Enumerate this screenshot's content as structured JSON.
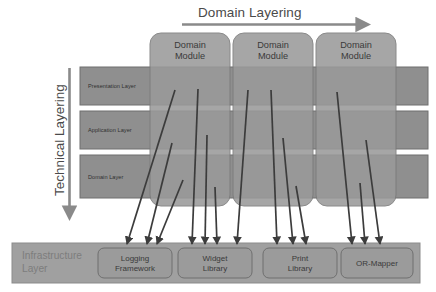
{
  "diagram": {
    "title_top": "Domain Layering",
    "title_left": "Technical Layering",
    "colors": {
      "module_fill": "#9a9a9a",
      "module_stroke": "#7b7b7b",
      "layer_fill": "#8f8f8f",
      "layer_stroke": "#6f6f6f",
      "infra_bar_fill": "#a0a0a0",
      "infra_box_fill": "#9b9b9b",
      "arrow_color": "#3c3c3c",
      "axis_arrow_color": "#8a8a8a",
      "background": "#ffffff"
    }
  },
  "domain_modules": [
    {
      "label": "Domain\nModule"
    },
    {
      "label": "Domain\nModule"
    },
    {
      "label": "Domain\nModule"
    }
  ],
  "technical_layers": [
    {
      "label": "Presentation Layer"
    },
    {
      "label": "Application Layer"
    },
    {
      "label": "Domain Layer"
    }
  ],
  "infrastructure": {
    "title": "Infrastructure\nLayer",
    "components": [
      {
        "label": "Logging\nFramework"
      },
      {
        "label": "Widget\nLibrary"
      },
      {
        "label": "Print\nLibrary"
      },
      {
        "label": "OR-Mapper"
      }
    ]
  }
}
